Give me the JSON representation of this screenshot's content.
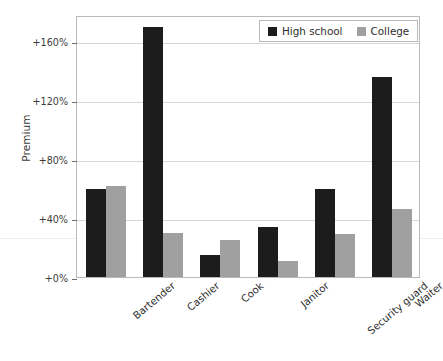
{
  "chart_data": {
    "type": "bar",
    "title": "",
    "xlabel": "",
    "ylabel": "Premium",
    "categories": [
      "Bartender",
      "Cashier",
      "Cook",
      "Janitor",
      "Security guard",
      "Waiter"
    ],
    "series": [
      {
        "name": "High school",
        "color": "#1c1c1c",
        "values": [
          60,
          170,
          15,
          34,
          60,
          136
        ]
      },
      {
        "name": "College",
        "color": "#a0a0a0",
        "values": [
          62,
          30,
          25,
          11,
          29,
          46
        ]
      }
    ],
    "ylim": [
      0,
      178
    ],
    "yticks": [
      0,
      40,
      80,
      120,
      160
    ],
    "ytick_labels": [
      "+0%",
      "+40%",
      "+80%",
      "+120%",
      "+160%"
    ],
    "grid": true,
    "legend_position": "top-right",
    "units": "percent"
  },
  "legend": {
    "entries": [
      {
        "label": "High school",
        "color": "#1c1c1c"
      },
      {
        "label": "College",
        "color": "#a0a0a0"
      }
    ]
  }
}
